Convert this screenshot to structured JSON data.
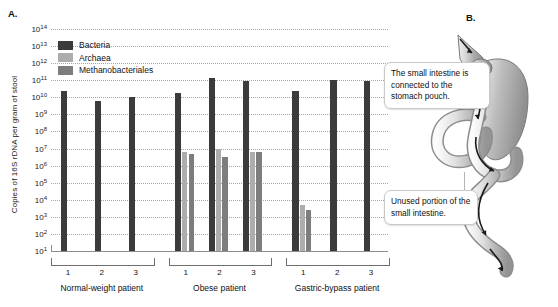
{
  "figure": {
    "panel_a_label": "A.",
    "panel_b_label": "B."
  },
  "chart_data": {
    "type": "bar",
    "title": "",
    "xlabel": "",
    "ylabel": "Copies of 16S rDNA per gram of stool",
    "yscale": "log",
    "ylim": [
      10,
      100000000000000
    ],
    "ytick_labels": [
      "10¹",
      "10²",
      "10³",
      "10⁴",
      "10⁵",
      "10⁶",
      "10⁷",
      "10⁸",
      "10⁹",
      "10¹⁰",
      "10¹¹",
      "10¹²",
      "10¹³",
      "10¹⁴"
    ],
    "ytick_exponents": [
      1,
      2,
      3,
      4,
      5,
      6,
      7,
      8,
      9,
      10,
      11,
      12,
      13,
      14
    ],
    "grid": true,
    "legend_position": "upper-left",
    "series": [
      {
        "name": "Bacteria",
        "color": "#3b3b3b",
        "values": [
          25000000000.0,
          6000000000.0,
          10000000000.0,
          17000000000.0,
          140000000000.0,
          90000000000.0,
          25000000000.0,
          100000000000.0,
          90000000000.0
        ]
      },
      {
        "name": "Archaea",
        "color": "#adadad",
        "values": [
          null,
          null,
          null,
          6000000.0,
          10000000.0,
          6000000.0,
          5000.0,
          null,
          null
        ]
      },
      {
        "name": "Methanobacteriales",
        "color": "#7d7d7d",
        "values": [
          null,
          null,
          null,
          5000000.0,
          3000000.0,
          6000000.0,
          2500.0,
          null,
          null
        ]
      }
    ],
    "categories": [
      "1",
      "2",
      "3",
      "1",
      "2",
      "3",
      "1",
      "2",
      "3"
    ],
    "groups": [
      {
        "label": "Normal-weight patient",
        "subjects": [
          "1",
          "2",
          "3"
        ]
      },
      {
        "label": "Obese patient",
        "subjects": [
          "1",
          "2",
          "3"
        ]
      },
      {
        "label": "Gastric-bypass patient",
        "subjects": [
          "1",
          "2",
          "3"
        ]
      }
    ]
  },
  "panel_b": {
    "callouts": [
      {
        "name": "small-intestine-connection",
        "text": "The small intestine is connected to the stomach pouch."
      },
      {
        "name": "unused-portion",
        "text": "Unused portion of the small intestine."
      }
    ]
  }
}
